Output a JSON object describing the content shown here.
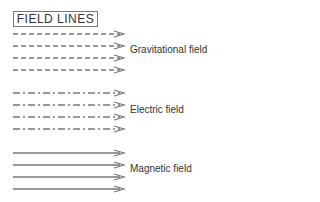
{
  "title": "FIELD LINES",
  "fields": [
    {
      "label": "Gravitational field",
      "style": "dashed",
      "lines_y": [
        34,
        46,
        58,
        70
      ],
      "label_y": 50
    },
    {
      "label": "Electric field",
      "style": "dash-dot",
      "lines_y": [
        93,
        105,
        117,
        129
      ],
      "label_y": 110
    },
    {
      "label": "Magnetic field",
      "style": "solid",
      "lines_y": [
        153,
        165,
        177,
        189
      ],
      "label_y": 169
    }
  ],
  "colors": {
    "line": "#777777",
    "text": "#333333"
  }
}
